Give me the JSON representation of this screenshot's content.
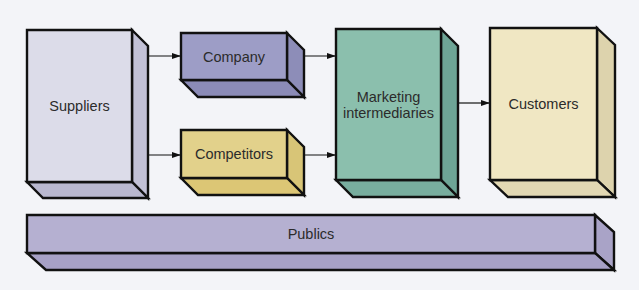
{
  "diagram": {
    "title": "",
    "background": "#f3f4f8",
    "stroke": "#111111",
    "nodes": [
      {
        "id": "suppliers",
        "label": "Suppliers",
        "x": 27,
        "y": 30,
        "w": 105,
        "h": 152,
        "dx": 16,
        "dy": 16,
        "front": "#dcdce9",
        "side": "#c2c1d6",
        "bottom": "#b9b8cf"
      },
      {
        "id": "company",
        "label": "Company",
        "x": 181,
        "y": 33,
        "w": 106,
        "h": 47,
        "dx": 17,
        "dy": 17,
        "front": "#9d9dc6",
        "side": "#8d8db8",
        "bottom": "#8b8bb7"
      },
      {
        "id": "competitors",
        "label": "Competitors",
        "x": 181,
        "y": 130,
        "w": 106,
        "h": 48,
        "dx": 17,
        "dy": 17,
        "front": "#e2d18b",
        "side": "#d8c577",
        "bottom": "#dcc675"
      },
      {
        "id": "marketing-intermediaries",
        "label": "Marketing intermediaries",
        "label_lines": [
          "Marketing",
          "intermediaries"
        ],
        "x": 336,
        "y": 29,
        "w": 105,
        "h": 151,
        "dx": 17,
        "dy": 17,
        "front": "#8bbfad",
        "side": "#6ea596",
        "bottom": "#78ad9e"
      },
      {
        "id": "customers",
        "label": "Customers",
        "x": 490,
        "y": 28,
        "w": 107,
        "h": 152,
        "dx": 18,
        "dy": 17,
        "front": "#f0e7c3",
        "side": "#ddd3ad",
        "bottom": "#e2d8b3"
      },
      {
        "id": "publics",
        "label": "Publics",
        "x": 27,
        "y": 215,
        "w": 568,
        "h": 38,
        "dx": 19,
        "dy": 17,
        "front": "#b5b0d1",
        "side": "#a9a3c7",
        "bottom": "#a7a1c6"
      }
    ],
    "edges": [
      {
        "from": "suppliers",
        "to": "company",
        "x1": 143,
        "y1": 56,
        "x2": 181,
        "y2": 56
      },
      {
        "from": "suppliers",
        "to": "competitors",
        "x1": 143,
        "y1": 155,
        "x2": 181,
        "y2": 155
      },
      {
        "from": "company",
        "to": "marketing-intermediaries",
        "x1": 303,
        "y1": 56,
        "x2": 336,
        "y2": 56
      },
      {
        "from": "competitors",
        "to": "marketing-intermediaries",
        "x1": 303,
        "y1": 155,
        "x2": 336,
        "y2": 155
      },
      {
        "from": "marketing-intermediaries",
        "to": "customers",
        "x1": 458,
        "y1": 103,
        "x2": 490,
        "y2": 103
      }
    ]
  }
}
